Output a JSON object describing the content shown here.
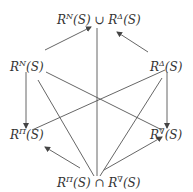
{
  "diagram": {
    "nodes": {
      "top": {
        "base": "R",
        "sup1": "N",
        "mid": "(S) ∪ R",
        "sup2": "Δ",
        "tail": "(S)"
      },
      "left_upper": {
        "base": "R",
        "sup": "N",
        "tail": "(S)"
      },
      "right_upper": {
        "base": "R",
        "sup": "Δ",
        "tail": "(S)"
      },
      "left_lower": {
        "base": "R",
        "sup": "Π",
        "tail": "(S)"
      },
      "right_lower": {
        "base": "R",
        "sup": "∇",
        "tail": "(S)"
      },
      "bottom": {
        "base": "R",
        "sup1": "Π",
        "mid": "(S) ∩ R",
        "sup2": "∇",
        "tail": "(S)"
      }
    },
    "edges": [
      {
        "from": "left_upper",
        "to": "top",
        "arrow": true
      },
      {
        "from": "right_upper",
        "to": "top",
        "arrow": true
      },
      {
        "from": "top",
        "to": "bottom",
        "arrow": false
      },
      {
        "from": "left_upper",
        "to": "left_lower",
        "arrow": true
      },
      {
        "from": "right_upper",
        "to": "right_lower",
        "arrow": true
      },
      {
        "from": "left_upper",
        "to": "right_lower",
        "arrow": false
      },
      {
        "from": "right_upper",
        "to": "left_lower",
        "arrow": false
      },
      {
        "from": "left_upper",
        "to": "bottom",
        "arrow": false
      },
      {
        "from": "right_upper",
        "to": "bottom",
        "arrow": false
      },
      {
        "from": "bottom",
        "to": "left_lower",
        "arrow": true
      },
      {
        "from": "bottom",
        "to": "right_lower",
        "arrow": true
      }
    ]
  }
}
